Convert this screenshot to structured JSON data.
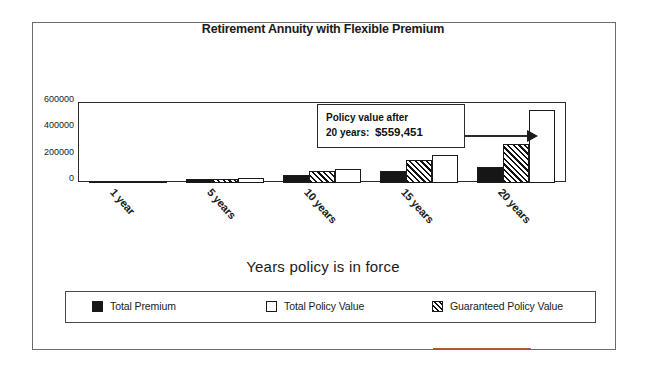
{
  "chart_data": {
    "type": "bar",
    "title": "Retirement Annuity with Flexible Premium",
    "xlabel": "Years policy is in force",
    "ylabel": "",
    "categories": [
      "1 year",
      "5 years",
      "10 years",
      "15 years",
      "20 years"
    ],
    "ylim": [
      0,
      600000
    ],
    "yticks": [
      0,
      200000,
      400000,
      600000
    ],
    "ytick_labels": [
      "0",
      "200000",
      "400000",
      "600000"
    ],
    "grid": false,
    "legend_position": "bottom",
    "series": [
      {
        "name": "Total Premium",
        "fill": "solid-black",
        "color": "#161616",
        "values": [
          6000,
          30000,
          60000,
          90000,
          120000
        ]
      },
      {
        "name": "Guaranteed Policy Value",
        "fill": "diagonal-hatch",
        "color": "#111111",
        "values": [
          5200,
          31000,
          87000,
          173000,
          300000
        ]
      },
      {
        "name": "Total Policy Value",
        "fill": "white",
        "color": "#ffffff",
        "values": [
          6100,
          33500,
          101000,
          216000,
          559451
        ]
      }
    ],
    "annotations": [
      {
        "line1": "Policy value after",
        "line2_prefix": "20 years:",
        "line2_value": "$559,451",
        "points_to": "20 years Total Policy Value bar"
      }
    ]
  },
  "yaxis": {
    "labels": [
      "600000",
      "400000",
      "200000",
      "0"
    ]
  },
  "xaxis": {
    "title": "Years policy is in force",
    "ticks": [
      "1 year",
      "5 years",
      "10 years",
      "15 years",
      "20 years"
    ]
  },
  "callout": {
    "line1": "Policy value after",
    "line2_label": "20 years:",
    "line2_amount": "$559,451"
  },
  "legend": {
    "items": [
      {
        "label": "Total Premium",
        "style": "premium"
      },
      {
        "label": "Total Policy Value",
        "style": "policy"
      },
      {
        "label": "Guaranteed Policy Value",
        "style": "guaranteed"
      }
    ]
  },
  "colors": {
    "premium": "#161616",
    "policy": "#ffffff",
    "guaranteed": "#111111",
    "axis": "#2b2b2b",
    "frame": "#6b6b6b"
  }
}
